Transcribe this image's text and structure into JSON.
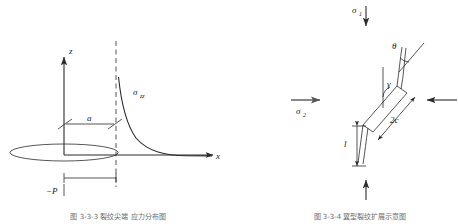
{
  "document": {
    "panel_count": 2,
    "background_color": "#ffffff",
    "ink_color": "#2b2b2b",
    "caption_color": "#6d6d6d"
  },
  "left_panel": {
    "name": "penny-shaped-crack-stress-distribution",
    "axes": {
      "vertical_label": "z",
      "horizontal_label": "x"
    },
    "curve_label": "σ",
    "curve_label_subscript": "zz",
    "dimension_label": "a",
    "load_label": "−P",
    "caption": "图 3-3-3    裂纹尖端    应力分布图"
  },
  "right_panel": {
    "name": "inclined-wing-crack-biaxial-loading",
    "stress_major": "σ",
    "stress_major_subscript": "1",
    "stress_minor": "σ",
    "stress_minor_subscript": "2",
    "angle_theta": "θ",
    "angle_gamma": "γ",
    "crack_length_label": "2c",
    "wing_length_label": "l",
    "caption": "图 3-3-4    翼型裂纹扩展示意图"
  }
}
